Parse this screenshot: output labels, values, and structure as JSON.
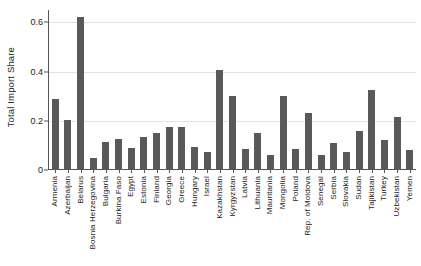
{
  "chart_data": {
    "type": "bar",
    "title": "",
    "subtitle": "",
    "xlabel": "",
    "ylabel": "Total Import Share",
    "ylim": [
      0,
      0.65
    ],
    "yticks": [
      0,
      0.2,
      0.4,
      0.6
    ],
    "ytick_labels": [
      "0",
      "0.2",
      "0.4",
      "0.6"
    ],
    "grid": true,
    "legend": null,
    "bar_color": "#595959",
    "categories": [
      "Armenia",
      "Azerbaijan",
      "Belarus",
      "Bosnia Herzegovina",
      "Bulgaria",
      "Burkina Faso",
      "Egypt",
      "Estonia",
      "Finland",
      "Georgia",
      "Greece",
      "Hungary",
      "Israel",
      "Kazakhstan",
      "Kyrgyzstan",
      "Latvia",
      "Lithuania",
      "Mauritania",
      "Mongolia",
      "Poland",
      "Rep. of Moldova",
      "Senegal",
      "Serbia",
      "Slovakia",
      "Sudan",
      "Tajikistan",
      "Turkey",
      "Uzbekistan",
      "Yemen"
    ],
    "values": [
      0.29,
      0.205,
      0.62,
      0.05,
      0.115,
      0.125,
      0.09,
      0.135,
      0.15,
      0.175,
      0.175,
      0.095,
      0.075,
      0.405,
      0.3,
      0.085,
      0.15,
      0.06,
      0.3,
      0.085,
      0.23,
      0.06,
      0.11,
      0.075,
      0.16,
      0.325,
      0.12,
      0.215,
      0.08
    ]
  }
}
